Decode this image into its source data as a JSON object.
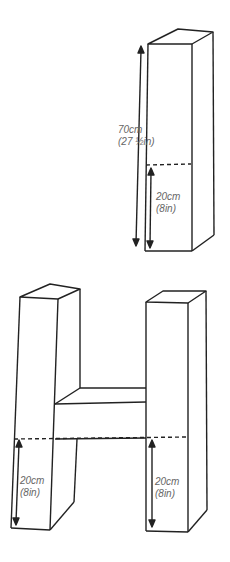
{
  "diagram": {
    "column": {
      "total_height": {
        "metric": "70cm",
        "imperial": "(27 ½in)"
      },
      "section_height": {
        "metric": "20cm",
        "imperial": "(8in)"
      }
    },
    "letter_h": {
      "left_leg": {
        "metric": "20cm",
        "imperial": "(8in)"
      },
      "right_leg": {
        "metric": "20cm",
        "imperial": "(8in)"
      }
    },
    "colors": {
      "line": "#222222",
      "label": "#666666"
    }
  }
}
